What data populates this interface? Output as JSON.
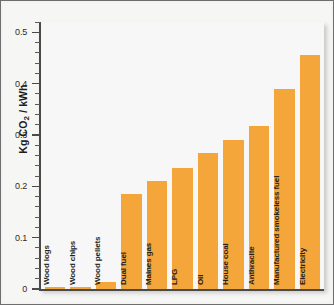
{
  "chart_data": {
    "type": "bar",
    "title": "",
    "subtitle": "",
    "xlabel": "",
    "ylabel": "Kg CO2 / kWh",
    "ylabel_rich": "Kg CO₂ / kWh",
    "ylim": [
      0,
      0.52
    ],
    "ytick_labels": [
      "0",
      "0.1",
      "0.2",
      "0.3",
      "0.4",
      "0.5"
    ],
    "ytick_values": [
      0,
      0.1,
      0.2,
      0.3,
      0.4,
      0.5
    ],
    "minor_ticks_per_interval": 5,
    "grid": false,
    "legend": null,
    "bar_color": "#f4a63a",
    "categories": [
      "Wood logs",
      "Wood chips",
      "Wood pellets",
      "Dual fuel",
      "Maines gas",
      "LPG",
      "Oil",
      "House coal",
      "Anthracite",
      "Manufactured smokeless fuel",
      "Electricity"
    ],
    "values": [
      0.003,
      0.003,
      0.014,
      0.185,
      0.211,
      0.235,
      0.265,
      0.291,
      0.318,
      0.389,
      0.455
    ],
    "series": [
      {
        "name": "Carbon emissions",
        "values": [
          0.003,
          0.003,
          0.014,
          0.185,
          0.211,
          0.235,
          0.265,
          0.291,
          0.318,
          0.389,
          0.455
        ]
      }
    ]
  },
  "figure": {
    "border_color": "#6e6e6e",
    "background_color": "#f6f6f4",
    "plot_background_color": "#f7f7f8",
    "axis_color": "#4a4a4a",
    "text_color": "#231f20"
  }
}
